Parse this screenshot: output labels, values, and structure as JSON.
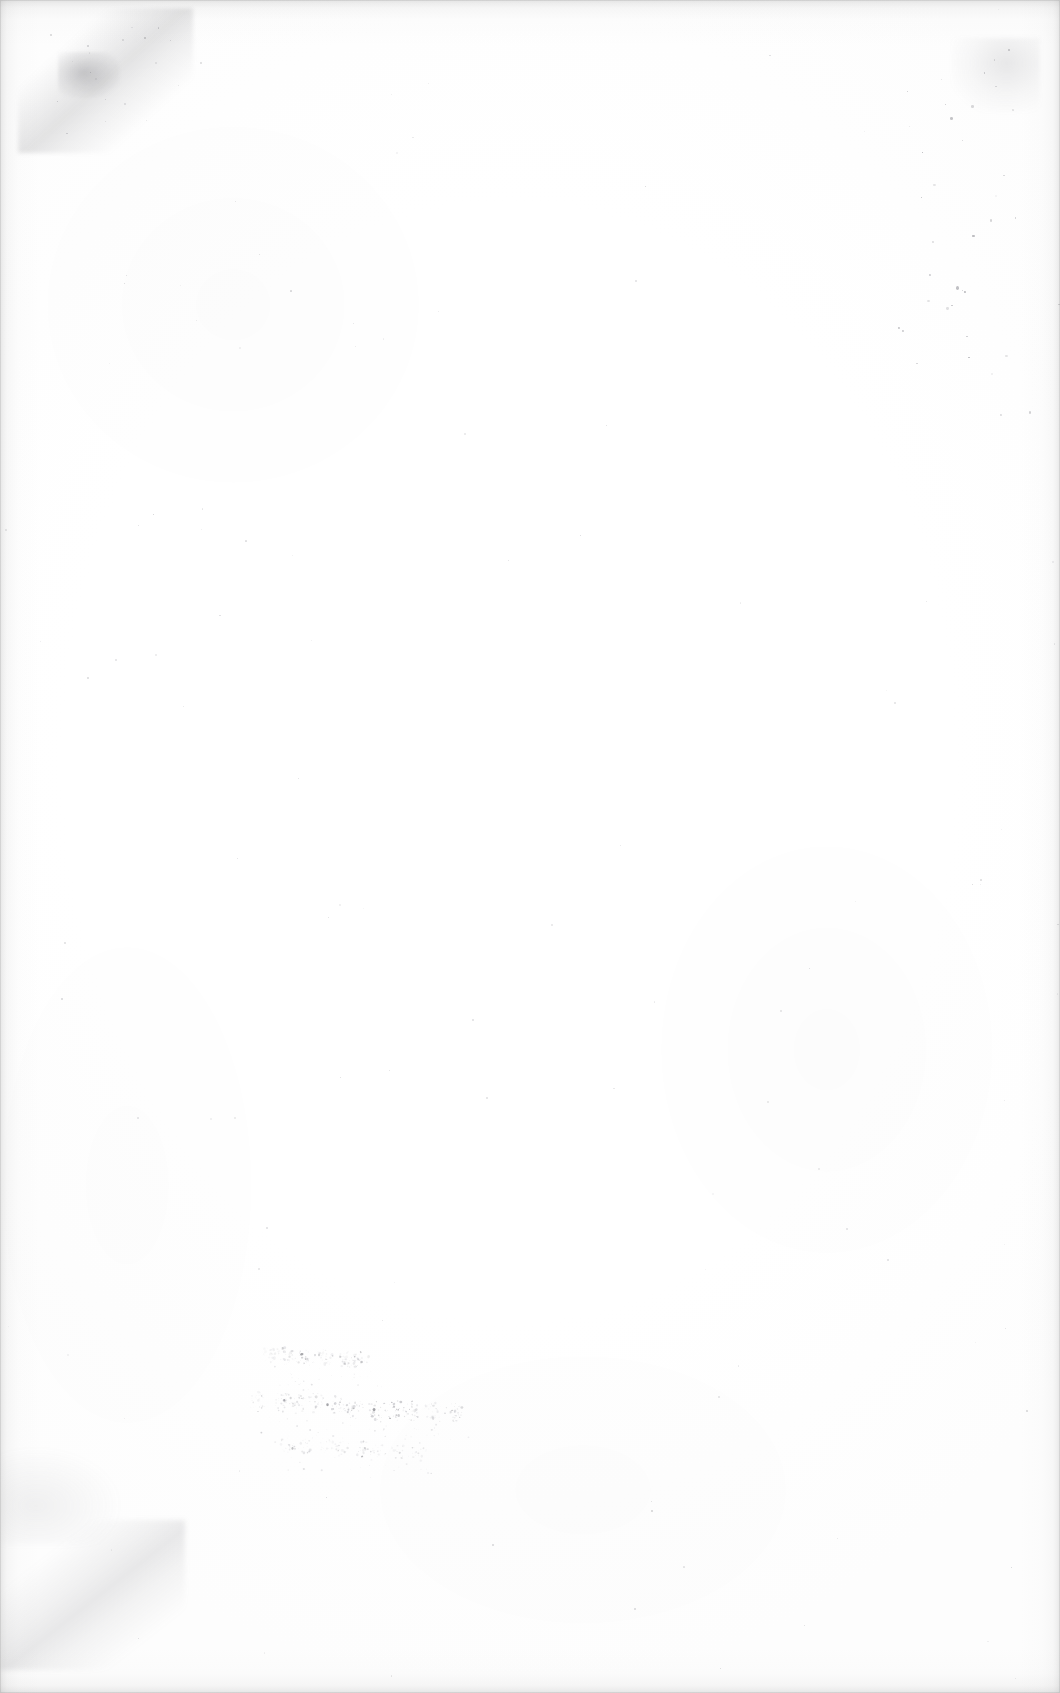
{
  "document": {
    "kind": "scanned-page",
    "legible_text": "",
    "description": "Blank scanned page from an old document with no printed or legible text",
    "page_width": 1060,
    "page_height": 1693
  },
  "colors": {
    "paper": "#ffffff",
    "paper_tint": "#fdfdfd",
    "edge_shadow": "#969696",
    "smudge": "#6e6e73",
    "ink_dark": "#4a4a52",
    "ink_mid": "#8e8e97",
    "ink_pale": "#b6b6bd"
  },
  "artifacts": [
    {
      "name": "edge-vignette",
      "type": "scanner-shadow",
      "location": "all four page borders",
      "legible_text": ""
    },
    {
      "name": "corner-smudge-top-left",
      "type": "crease-or-smudge",
      "location": "top-left corner, diagonal down-right",
      "legible_text": ""
    },
    {
      "name": "corner-smudge-bottom-left",
      "type": "crease-or-smudge",
      "location": "bottom-left corner, diagonal down-right",
      "legible_text": ""
    },
    {
      "name": "speck-trail-right",
      "type": "dust-specks",
      "location": "right edge, vertical scatter",
      "legible_text": ""
    },
    {
      "name": "handwritten-annotation",
      "type": "faded-handwriting",
      "location": "lower-left quadrant",
      "lines": 3,
      "condition": "ink disintegrated to speckle; no recoverable letterforms",
      "legible_text": ""
    }
  ]
}
